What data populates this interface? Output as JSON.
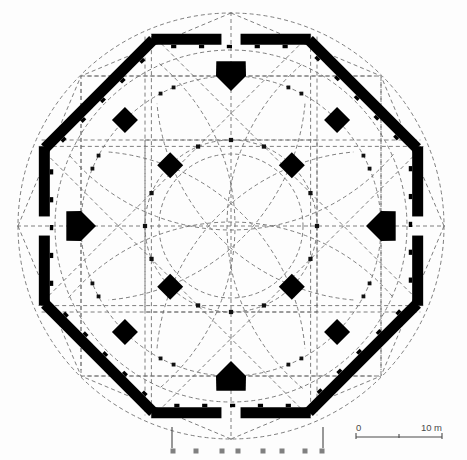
{
  "figure": {
    "kind": "architectural-floor-plan",
    "background_color": "#fdfdfd",
    "ink_color": "#000000",
    "construction_line_color": "#6f6f6f",
    "column_dot_color": "#111111"
  },
  "scale_bar": {
    "start_label": "0",
    "end_label": "10 m",
    "unit": "m",
    "length_meters": 10,
    "tick_count": 3,
    "pixel_length": 86,
    "x": 356,
    "y": 437,
    "label_color": "#4a4a4a"
  },
  "geometry": {
    "center": {
      "x": 231,
      "y": 226
    },
    "outer_circle_radius": 213,
    "outer_octagon": {
      "sides": 8,
      "circumradius": 208,
      "rotation_deg": 22.5,
      "wall_thickness": 11,
      "entrance_gaps": [
        "north",
        "east",
        "south",
        "west"
      ],
      "gap_half_angle_deg": 7.0
    },
    "second_circle_radius": 176,
    "third_circle_radius": 150,
    "inner_circle_radius": 86,
    "innermost_circle_radius": 72,
    "outer_dashed_square_half": 150,
    "inner_dashed_square_half": 86,
    "intermediate_arcade": {
      "pier_count": 8,
      "pier_radius": 150,
      "diagonal_pier_size": 13,
      "axial_pier_size": 15,
      "column_count": 16,
      "column_radius": 150
    },
    "central_arcade": {
      "pier_count": 4,
      "pier_radius": 86,
      "pier_size": 13,
      "column_count": 12,
      "column_radius": 86
    }
  },
  "annotations": {
    "plinth_row": {
      "label": "south plinth / step markers",
      "y": 451,
      "square_size": 5,
      "square_color": "#808080",
      "x_positions": [
        173,
        196,
        222,
        238,
        263,
        282,
        305,
        322
      ],
      "bracket_left_x": 172,
      "bracket_right_x": 323,
      "bracket_top_y": 427
    }
  },
  "legend": {
    "solid_black": "standing masonry",
    "dashed_grey": "geometric construction lines",
    "small_squares": "column positions"
  }
}
